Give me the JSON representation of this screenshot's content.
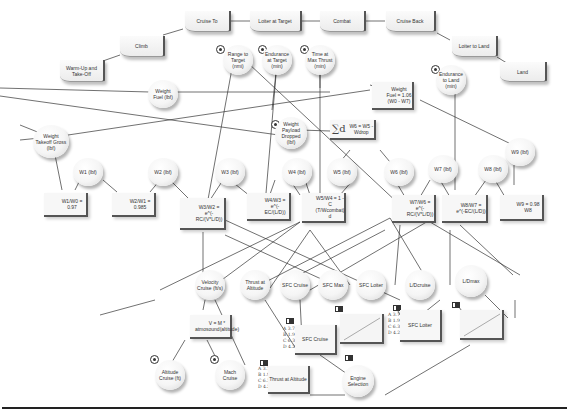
{
  "phases": [
    {
      "id": "warmup",
      "label": "Warm-Up and Take-Off"
    },
    {
      "id": "climb",
      "label": "Climb"
    },
    {
      "id": "cruise_to",
      "label": "Cruise To"
    },
    {
      "id": "loiter_target",
      "label": "Loiter at Target"
    },
    {
      "id": "combat",
      "label": "Combat"
    },
    {
      "id": "cruise_back",
      "label": "Cruise Back"
    },
    {
      "id": "loiter_land",
      "label": "Loiter to Land"
    },
    {
      "id": "land",
      "label": "Land"
    }
  ],
  "decisions": {
    "range_to_target": "Range to Target (nmi)",
    "endurance_at_target": "Endurance at Target (min)",
    "time_max_thrust": "Time at Max Thrust (min)",
    "endurance_to_land": "Endurance to Land (min)",
    "weight_payload_dropped": "Weight Payload Dropped (lbf)",
    "altitude_cruise": "Altitude Cruise (ft)",
    "mach_cruise": "Mach Cruise"
  },
  "variables": {
    "weight_fuel": "Weight Fuel (lbf)",
    "weight_takeoff_gross": "Weight Takeoff Gross (lbf)",
    "w1": "W1 (lbf)",
    "w2": "W2 (lbf)",
    "w3": "W3 (lbf)",
    "w4": "W4 (lbf)",
    "w5": "W5 (lbf)",
    "w6": "W6 (lbf)",
    "w7": "W7 (lbf)",
    "w8": "W8 (lbf)",
    "w9": "W9 (lbf)",
    "velocity_cruise": "Velocity Cruise (ft/s)",
    "thrust_at_altitude": "Thrust at Altitude",
    "spc_cruise": "SFC Cruise",
    "spc_max": "SFC Max",
    "spc_loiter": "SFC Loiter",
    "ld_cruise": "L/Dcruise",
    "ld_max": "L/Dmax",
    "engine_selection": "Engine Selection"
  },
  "equations": {
    "weight_fuel_eq": "Weight Fuel = 1.06 (W0 - W7)",
    "w5_sum": "W6 = W5 - Wdrop",
    "w1w0": "W1/W0 = 0.97",
    "w2w1": "W2/W1 = 0.985",
    "w3w2": "W3/W2 = e^(-RC/(V*L/D))",
    "w4w3": "W4/W3 = e^(-EC/(L/D))",
    "w5w4": "W5/W4 = 1 - C (T/Wcombat) d",
    "w7w6": "W7/W6 = e^(-RC/(V*L/D))",
    "w8w7": "W8/W7 = e^(-EC/(L/D))",
    "w9w8": "W9 = 0.98 W8",
    "velocity_eq": "V = M * atmosound(altitude)"
  },
  "tables": {
    "options": [
      "A 3.7",
      "B 1.9",
      "C 6.3",
      "D 4.2"
    ],
    "selected": "B 1.9",
    "spc_cruise_tbl": "SFC Cruise",
    "spc_loiter_tbl": "SFC Loiter",
    "thrust_tbl": "Thrust at Altitude"
  },
  "icons": {
    "sum_glyph": "∑d",
    "eq_glyph": "ʸ∫ᵃ\n  ⁵∫ᵧ\n e³"
  }
}
